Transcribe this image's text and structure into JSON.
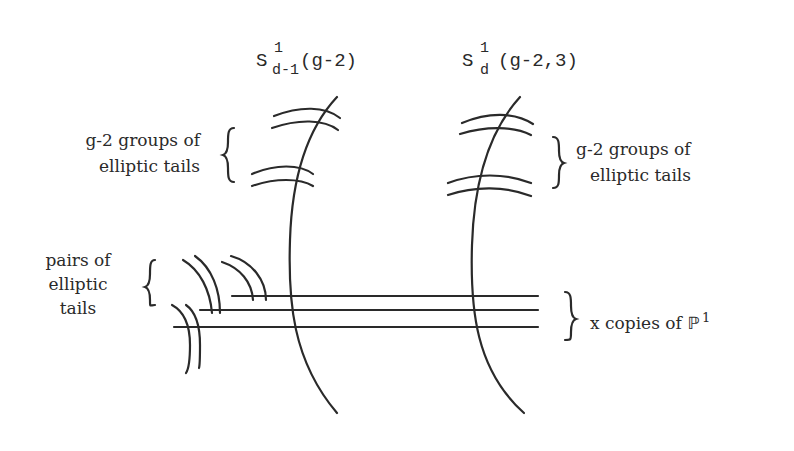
{
  "diagram": {
    "colors": {
      "ink": "#2a2a2a",
      "background": "#ffffff"
    },
    "components": [
      {
        "id": "left-component",
        "symbol": "S",
        "superscript": "1",
        "subscript": "d-1",
        "argument": "(g-2)"
      },
      {
        "id": "right-component",
        "symbol": "S",
        "superscript": "1",
        "subscript": "d",
        "argument": "(g-2,3)"
      }
    ],
    "labels": {
      "left_tails_line1": "g-2 groups of",
      "left_tails_line2": "elliptic tails",
      "right_tails_line1": "g-2 groups of",
      "right_tails_line2": "elliptic tails",
      "pairs_line1": "pairs of",
      "pairs_line2": "elliptic",
      "pairs_line3": "tails",
      "copies_text": "x copies of ",
      "copies_symbol": "ℙ",
      "copies_superscript": "1"
    }
  }
}
